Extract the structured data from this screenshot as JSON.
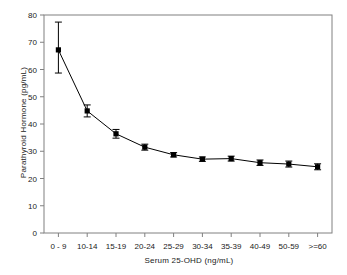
{
  "chart_data": {
    "type": "line",
    "title": "",
    "xlabel": "Serum 25-OHD (ng/mL)",
    "ylabel": "Parathyroid Hormone (pg/mL)",
    "categories": [
      "0 - 9",
      "10-14",
      "15-19",
      "20-24",
      "25-29",
      "30-34",
      "35-39",
      "40-49",
      "50-59",
      ">=60"
    ],
    "values": [
      67.2,
      44.8,
      36.4,
      31.5,
      28.7,
      27.1,
      27.3,
      25.8,
      25.3,
      24.3
    ],
    "error_upper": [
      77.4,
      47.0,
      38.0,
      32.6,
      29.5,
      27.9,
      28.2,
      26.8,
      26.4,
      25.4
    ],
    "error_lower": [
      58.7,
      42.6,
      34.8,
      30.4,
      27.9,
      26.3,
      26.4,
      24.8,
      24.2,
      23.2
    ],
    "ylim": [
      0,
      80
    ],
    "ytick_values": [
      0,
      10,
      20,
      30,
      40,
      50,
      60,
      70,
      80
    ],
    "ytick_labels": [
      "0",
      "10",
      "20",
      "30",
      "40",
      "50",
      "60",
      "70",
      "80"
    ],
    "grid": false,
    "legend": null,
    "marker": "filled-square",
    "series_color": "#000000",
    "frame_color": "#808080"
  },
  "axes": {
    "x_title": "Serum 25-OHD (ng/mL)",
    "y_title": "Parathyroid Hormone (pg/mL)"
  }
}
